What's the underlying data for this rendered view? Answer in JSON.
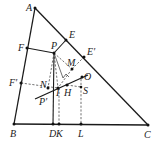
{
  "figure": {
    "type": "geometry-diagram",
    "points": {
      "A": {
        "label": "A",
        "x": 35,
        "y": 8
      },
      "B": {
        "label": "B",
        "x": 14,
        "y": 124
      },
      "C": {
        "label": "C",
        "x": 148,
        "y": 125
      },
      "D": {
        "label": "D",
        "x": 53,
        "y": 124
      },
      "K": {
        "label": "K",
        "x": 59,
        "y": 124
      },
      "L": {
        "label": "L",
        "x": 81,
        "y": 124
      },
      "E": {
        "label": "E",
        "x": 66,
        "y": 40
      },
      "E2": {
        "label": "E′",
        "x": 84,
        "y": 57
      },
      "F": {
        "label": "F",
        "x": 27,
        "y": 48
      },
      "F2": {
        "label": "F′",
        "x": 21,
        "y": 83
      },
      "P": {
        "label": "P",
        "x": 54,
        "y": 53
      },
      "P2": {
        "label": "P′",
        "x": 40,
        "y": 96
      },
      "M": {
        "label": "M",
        "x": 72,
        "y": 69
      },
      "N": {
        "label": "N",
        "x": 48,
        "y": 88
      },
      "I": {
        "label": "I",
        "x": 58,
        "y": 88
      },
      "H": {
        "label": "H",
        "x": 67,
        "y": 85
      },
      "O": {
        "label": "O",
        "x": 82,
        "y": 79
      },
      "S": {
        "label": "S",
        "x": 81,
        "y": 87
      }
    },
    "labels": {
      "A": "A",
      "B": "B",
      "C": "C",
      "D": "D",
      "K": "K",
      "L": "L",
      "E": "E",
      "E2": "E′",
      "F": "F",
      "F2": "F′",
      "P": "P",
      "P2": "P′",
      "M": "M",
      "N": "N",
      "I": "I",
      "H": "H",
      "O": "O",
      "S": "S"
    },
    "segments_solid": [
      "AB",
      "BC",
      "CA",
      "FP",
      "PE",
      "PD",
      "P′O-line"
    ],
    "segments_dashed": [
      "F′I",
      "PN",
      "PI",
      "PM",
      "ME′",
      "IK",
      "OL",
      "HS"
    ]
  }
}
